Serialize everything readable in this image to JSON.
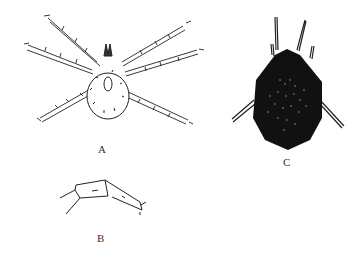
{
  "figure": {
    "panels": [
      {
        "id": "A",
        "label": "A",
        "description": "mite dorsal view, line drawing, eight legs"
      },
      {
        "id": "B",
        "label": "B",
        "description": "leg segment detail"
      },
      {
        "id": "C",
        "label": "C",
        "description": "mite dorsal view, dark stippled body"
      }
    ]
  }
}
